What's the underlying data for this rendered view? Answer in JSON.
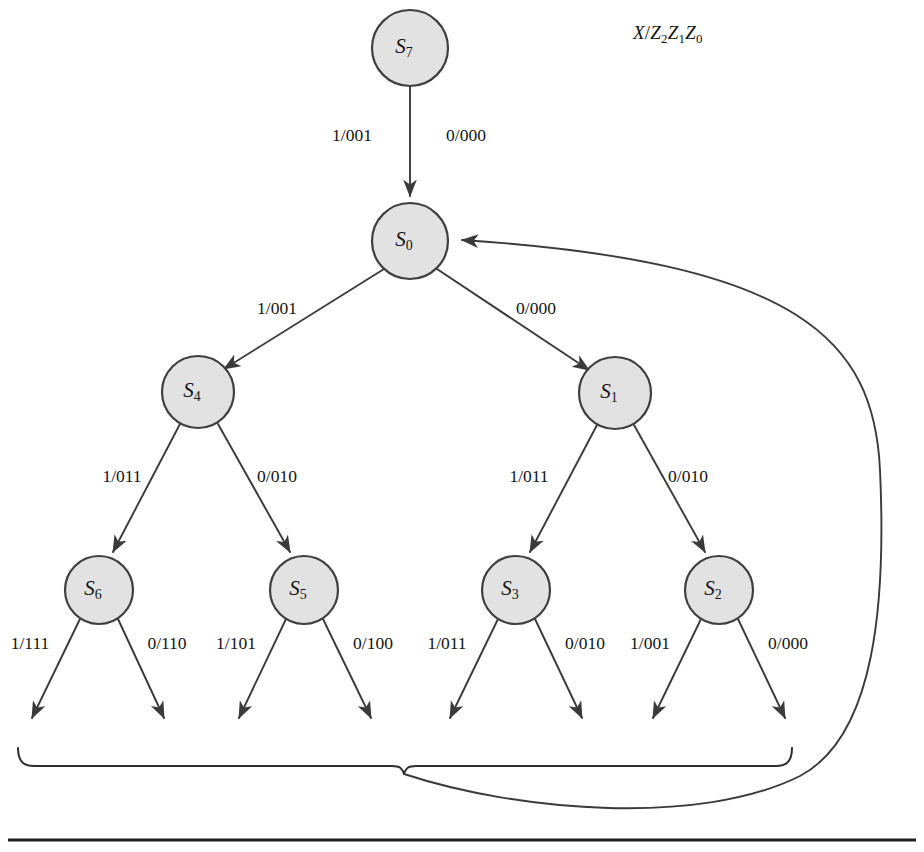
{
  "figure": {
    "type": "state-transition-tree-diagram",
    "legend": {
      "input_symbol": "X",
      "separator": "/",
      "output_bits": [
        "Z",
        "2",
        "Z",
        "1",
        "Z",
        "0"
      ],
      "full_text": "X/Z2Z1Z0"
    },
    "background_color": "#ffffff",
    "node_fill_color": "#e2e2e2",
    "node_stroke_color": "#3f3f3f",
    "line_color": "#3a3a3a"
  },
  "nodes": [
    {
      "id": "S7",
      "letter": "S",
      "subscript": "7",
      "cx": 410,
      "cy": 48,
      "r": 38,
      "level": 0
    },
    {
      "id": "S0",
      "letter": "S",
      "subscript": "0",
      "cx": 410,
      "cy": 241,
      "r": 38,
      "level": 1
    },
    {
      "id": "S4",
      "letter": "S",
      "subscript": "4",
      "cx": 198,
      "cy": 392,
      "r": 36,
      "level": 2
    },
    {
      "id": "S1",
      "letter": "S",
      "subscript": "1",
      "cx": 615,
      "cy": 393,
      "r": 36,
      "level": 2
    },
    {
      "id": "S6",
      "letter": "S",
      "subscript": "6",
      "cx": 99,
      "cy": 590,
      "r": 34,
      "level": 3
    },
    {
      "id": "S5",
      "letter": "S",
      "subscript": "5",
      "cx": 304,
      "cy": 590,
      "r": 34,
      "level": 3
    },
    {
      "id": "S3",
      "letter": "S",
      "subscript": "3",
      "cx": 516,
      "cy": 590,
      "r": 34,
      "level": 3
    },
    {
      "id": "S2",
      "letter": "S",
      "subscript": "2",
      "cx": 719,
      "cy": 590,
      "r": 34,
      "level": 3
    }
  ],
  "transitions": [
    {
      "from": "S7",
      "to": "S0",
      "label": "1/001",
      "label_x": 352,
      "label_y": 137,
      "kind": "shared-vertical"
    },
    {
      "from": "S7",
      "to": "S0",
      "label": "0/000",
      "label_x": 466,
      "label_y": 137,
      "kind": "shared-vertical"
    },
    {
      "from": "S0",
      "to": "S4",
      "label": "1/001",
      "label_x": 277,
      "label_y": 310,
      "kind": "branch-left"
    },
    {
      "from": "S0",
      "to": "S1",
      "label": "0/000",
      "label_x": 536,
      "label_y": 310,
      "kind": "branch-right"
    },
    {
      "from": "S4",
      "to": "S6",
      "label": "1/011",
      "label_x": 122,
      "label_y": 478,
      "kind": "branch-left"
    },
    {
      "from": "S4",
      "to": "S5",
      "label": "0/010",
      "label_x": 277,
      "label_y": 478,
      "kind": "branch-right"
    },
    {
      "from": "S1",
      "to": "S3",
      "label": "1/011",
      "label_x": 529,
      "label_y": 478,
      "kind": "branch-left"
    },
    {
      "from": "S1",
      "to": "S2",
      "label": "0/010",
      "label_x": 688,
      "label_y": 478,
      "kind": "branch-right"
    },
    {
      "from": "S6",
      "to": "leaf1",
      "label": "1/111",
      "label_x": 30,
      "label_y": 645,
      "kind": "leaf-left"
    },
    {
      "from": "S6",
      "to": "leaf2",
      "label": "0/110",
      "label_x": 167,
      "label_y": 645,
      "kind": "leaf-right"
    },
    {
      "from": "S5",
      "to": "leaf3",
      "label": "1/101",
      "label_x": 236,
      "label_y": 645,
      "kind": "leaf-left"
    },
    {
      "from": "S5",
      "to": "leaf4",
      "label": "0/100",
      "label_x": 373,
      "label_y": 645,
      "kind": "leaf-right"
    },
    {
      "from": "S3",
      "to": "leaf5",
      "label": "1/011",
      "label_x": 447,
      "label_y": 645,
      "kind": "leaf-left"
    },
    {
      "from": "S3",
      "to": "leaf6",
      "label": "0/010",
      "label_x": 585,
      "label_y": 645,
      "kind": "leaf-right"
    },
    {
      "from": "S2",
      "to": "leaf7",
      "label": "1/001",
      "label_x": 650,
      "label_y": 645,
      "kind": "leaf-left"
    },
    {
      "from": "S2",
      "to": "leaf8",
      "label": "0/000",
      "label_x": 788,
      "label_y": 645,
      "kind": "leaf-right"
    }
  ],
  "leaf_arrow_endpoints": [
    {
      "id": "leaf1",
      "x": 30,
      "y": 726
    },
    {
      "id": "leaf2",
      "x": 166,
      "y": 726
    },
    {
      "id": "leaf3",
      "x": 237,
      "y": 726
    },
    {
      "id": "leaf4",
      "x": 373,
      "y": 726
    },
    {
      "id": "leaf5",
      "x": 448,
      "y": 726
    },
    {
      "id": "leaf6",
      "x": 584,
      "y": 726
    },
    {
      "id": "leaf7",
      "x": 651,
      "y": 726
    },
    {
      "id": "leaf8",
      "x": 787,
      "y": 726
    }
  ],
  "brace": {
    "left_x": 18,
    "right_x": 792,
    "top_y": 748,
    "center_x": 404,
    "center_y": 772
  },
  "feedback_edge": {
    "from": "brace-center",
    "to": "S0",
    "target_x": 452,
    "target_y": 241,
    "max_x": 880
  },
  "bottom_rule": {
    "x1": 8,
    "x2": 916,
    "y": 840
  }
}
